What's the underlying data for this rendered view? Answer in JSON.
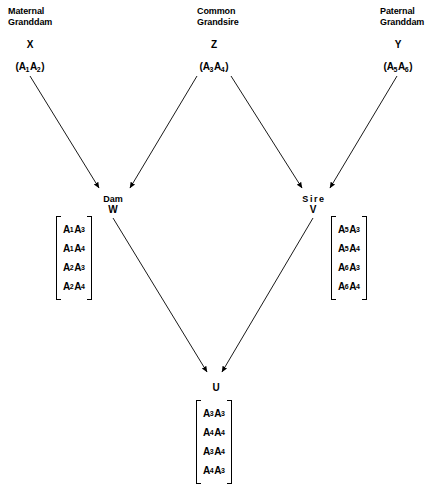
{
  "diagram": {
    "line_color": "#000000",
    "text_color": "#000000",
    "background": "#ffffff"
  },
  "columns": [
    {
      "header_line1": "Maternal",
      "header_line2": "Granddam",
      "ident": "X"
    },
    {
      "header_line1": "Common",
      "header_line2": "Grandsire",
      "ident": "Z"
    },
    {
      "header_line1": "Paternal",
      "header_line2": "Granddam",
      "ident": "Y"
    }
  ],
  "grandparents": [
    {
      "ident": "X",
      "genotype_open": "(",
      "allele1": "A",
      "sub1": "1",
      "allele2": "A",
      "sub2": "2",
      "genotype_close": ")"
    },
    {
      "ident": "Z",
      "genotype_open": "(",
      "allele1": "A",
      "sub1": "3",
      "allele2": "A",
      "sub2": "4",
      "genotype_close": ")"
    },
    {
      "ident": "Y",
      "genotype_open": "(",
      "allele1": "A",
      "sub1": "5",
      "allele2": "A",
      "sub2": "6",
      "genotype_close": ")"
    }
  ],
  "parents": {
    "dam": {
      "name": "Dam",
      "ident": "W"
    },
    "sire": {
      "name": "Sire",
      "ident": "V"
    }
  },
  "offspring": {
    "ident": "U"
  },
  "matrices": {
    "dam": {
      "owner": "W",
      "rows": [
        {
          "a1": "A",
          "s1": "1",
          "a2": "A",
          "s2": "3"
        },
        {
          "a1": "A",
          "s1": "1",
          "a2": "A",
          "s2": "4"
        },
        {
          "a1": "A",
          "s1": "2",
          "a2": "A",
          "s2": "3"
        },
        {
          "a1": "A",
          "s1": "2",
          "a2": "A",
          "s2": "4"
        }
      ]
    },
    "sire": {
      "owner": "V",
      "rows": [
        {
          "a1": "A",
          "s1": "5",
          "a2": "A",
          "s2": "3"
        },
        {
          "a1": "A",
          "s1": "5",
          "a2": "A",
          "s2": "4"
        },
        {
          "a1": "A",
          "s1": "6",
          "a2": "A",
          "s2": "3"
        },
        {
          "a1": "A",
          "s1": "6",
          "a2": "A",
          "s2": "4"
        }
      ]
    },
    "offspring": {
      "owner": "U",
      "rows": [
        {
          "a1": "A",
          "s1": "3",
          "a2": "A",
          "s2": "3"
        },
        {
          "a1": "A",
          "s1": "4",
          "a2": "A",
          "s2": "4"
        },
        {
          "a1": "A",
          "s1": "3",
          "a2": "A",
          "s2": "4"
        },
        {
          "a1": "A",
          "s1": "4",
          "a2": "A",
          "s2": "3"
        }
      ]
    }
  },
  "edges": [
    {
      "from": "X",
      "to": "W"
    },
    {
      "from": "Z",
      "to": "W"
    },
    {
      "from": "Z",
      "to": "V"
    },
    {
      "from": "Y",
      "to": "V"
    },
    {
      "from": "W",
      "to": "U"
    },
    {
      "from": "V",
      "to": "U"
    }
  ]
}
